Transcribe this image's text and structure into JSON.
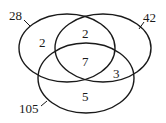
{
  "diagram": {
    "type": "venn",
    "sets": [
      {
        "name": "left-set",
        "total_label": "28"
      },
      {
        "name": "right-set",
        "total_label": "42"
      },
      {
        "name": "bottom-set",
        "total_label": "105"
      }
    ],
    "regions": {
      "left_only": "2",
      "left_right": "2",
      "all_three": "7",
      "right_bottom": "3",
      "bottom_only": "5"
    }
  }
}
